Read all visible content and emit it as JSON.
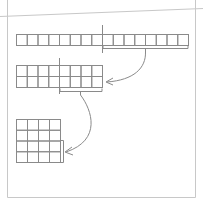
{
  "diagram": {
    "type": "reshape-illustration",
    "colors": {
      "frame": "#c8c8c8",
      "grid": "#8a8a8a",
      "arrow": "#8a8a8a",
      "background": "#ffffff"
    },
    "strip": {
      "rows": 1,
      "cols": 16,
      "x": 16,
      "y": 34,
      "w": 172,
      "h": 11,
      "split_x": 102
    },
    "grid2": {
      "rows": 2,
      "cols": 8,
      "x": 16,
      "y": 65,
      "w": 86,
      "h": 22,
      "split_x": 59
    },
    "grid4": {
      "rows": 4,
      "cols": 4,
      "x": 16,
      "y": 119,
      "w": 44,
      "h": 43
    }
  }
}
